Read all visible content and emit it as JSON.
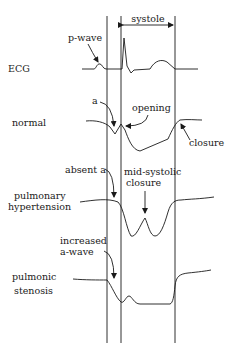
{
  "diagram": {
    "header": {
      "systole_label": "systole"
    },
    "traces": [
      {
        "id": "ecg",
        "label_lines": [
          "ECG"
        ]
      },
      {
        "id": "normal",
        "label_lines": [
          "normal"
        ]
      },
      {
        "id": "pulmonary-hypertension",
        "label_lines": [
          "pulmonary",
          "hypertension"
        ]
      },
      {
        "id": "pulmonic-stenosis",
        "label_lines": [
          "pulmonic",
          "stenosis"
        ]
      }
    ],
    "annotations": {
      "p_wave": "p-wave",
      "a": "a",
      "opening": "opening",
      "closure": "closure",
      "absent_a": "absent a",
      "mid_systolic_line1": "mid-systolic",
      "mid_systolic_line2": "closure",
      "increased_line1": "increased",
      "increased_line2": "a-wave"
    },
    "colors": {
      "ink": "#1a1a1a",
      "background": "#ffffff"
    }
  }
}
